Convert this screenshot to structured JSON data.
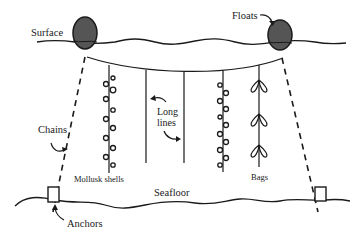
{
  "diagram": {
    "labels": {
      "surface": "Surface",
      "floats": "Floats",
      "long_lines_1": "Long",
      "long_lines_2": "lines",
      "chains": "Chains",
      "mollusk_shells": "Mollusk shells",
      "bags": "Bags",
      "seafloor": "Seafloor",
      "anchors": "Anchors"
    },
    "colors": {
      "ink": "#1a1a1a",
      "float_fill": "#555555",
      "background": "#ffffff"
    }
  }
}
